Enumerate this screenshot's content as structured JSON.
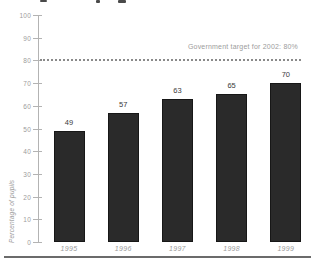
{
  "chart_data": {
    "type": "bar",
    "categories": [
      "1995",
      "1996",
      "1997",
      "1998",
      "1999"
    ],
    "values": [
      49,
      57,
      63,
      65,
      70
    ],
    "title": "",
    "xlabel": "",
    "ylabel": "Percentage of pupils",
    "ylim": [
      0,
      100
    ],
    "ytick_step": 10,
    "grid": false,
    "legend": "none",
    "annotation": {
      "label": "Government target for 2002: 80%",
      "value": 80
    },
    "bar_color": "#2a2a2a",
    "target_line_style": "dotted"
  },
  "colors": {
    "bar": "#2a2a2a",
    "bar_border": "#171717",
    "axis": "#b3b3b3",
    "tick_text": "#9c9c9c",
    "value_text": "#3b3b3b",
    "target_line": "#8a8a8a",
    "bottom_rule": "#6b6b6b"
  }
}
